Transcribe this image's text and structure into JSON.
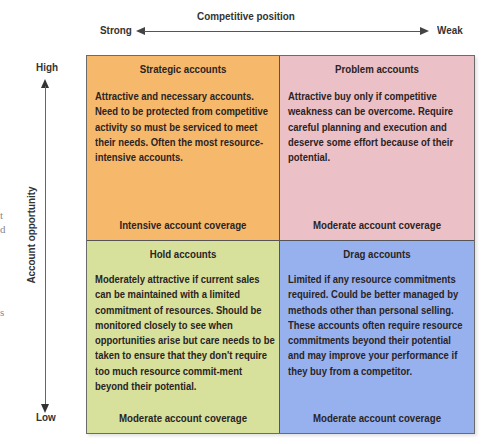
{
  "axes": {
    "horizontal": {
      "title": "Competitive position",
      "left_label": "Strong",
      "right_label": "Weak"
    },
    "vertical": {
      "title": "Account opportunity",
      "top_label": "High",
      "bottom_label": "Low"
    }
  },
  "quadrants": [
    {
      "title": "Strategic accounts",
      "description": "Attractive and necessary accounts. Need to be protected from competitive activity so must be serviced to meet their needs. Often the most resource-intensive accounts.",
      "coverage": "Intensive account coverage",
      "color": "#f6b96b"
    },
    {
      "title": "Problem accounts",
      "description": "Attractive buy only if competitive weakness can be overcome. Require careful planning and execution and deserve some effort because of their potential.",
      "coverage": "Moderate account coverage",
      "color": "#ecc0c7"
    },
    {
      "title": "Hold accounts",
      "description": "Moderately attractive if current sales can be maintained with a limited commitment of resources. Should be monitored closely to see when opportunities arise but care needs to be taken to ensure that they don't require too much resource commit-ment beyond their potential.",
      "coverage": "Moderate account coverage",
      "color": "#d7e19c"
    },
    {
      "title": "Drag accounts",
      "description": "Limited if any resource commitments required. Could be better managed by methods other than personal selling. These accounts often require resource commitments beyond their potential and may improve your performance if they buy from a competitor.",
      "coverage": "Moderate account coverage",
      "color": "#97b1ef"
    }
  ],
  "margin_fragments": [
    "t",
    "d",
    "s"
  ]
}
